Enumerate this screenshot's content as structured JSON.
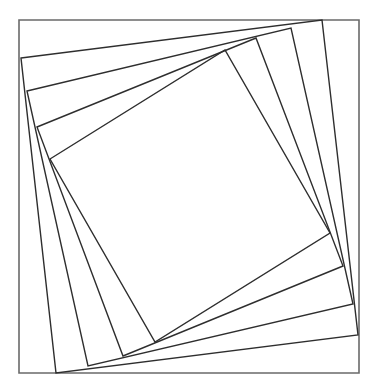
{
  "diagram": {
    "type": "nested-rotated-squares",
    "width": 378,
    "height": 391,
    "colors": {
      "background": "#ffffff",
      "outer_stroke": "#6a6a6a",
      "inner_stroke": "#2e2e2e"
    },
    "outer_square": {
      "points": "19,20 359,20 359,373 19,373"
    },
    "inner_squares": [
      {
        "points": "21,58 322,20 358,335 56,373"
      },
      {
        "points": "27,91 291,28 353,304 88,366"
      },
      {
        "points": "37,127 256,38 343,266 123,356"
      },
      {
        "points": "50,159 225,50 330,233 155,342"
      }
    ]
  }
}
